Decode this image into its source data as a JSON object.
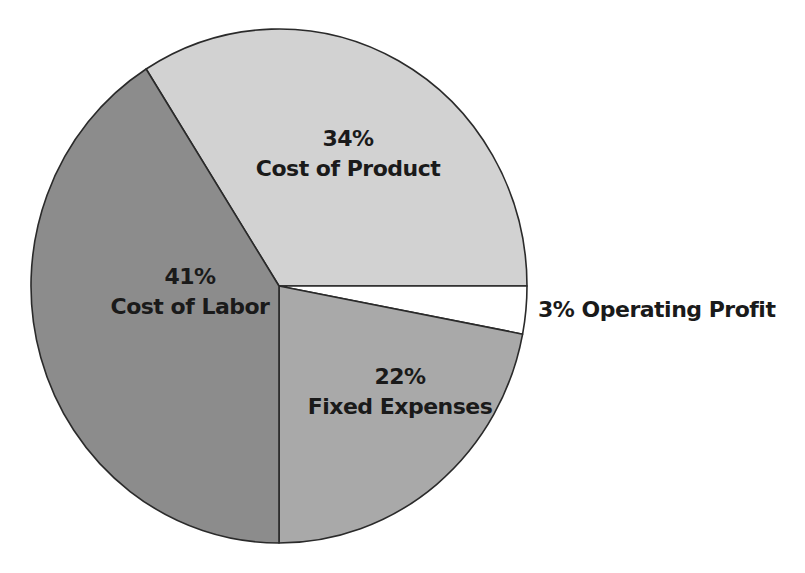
{
  "chart_data": {
    "type": "pie",
    "title": "",
    "slices": [
      {
        "label": "Cost of Product",
        "value": 34,
        "display": "34%",
        "color": "#d2d2d2"
      },
      {
        "label": "Operating Profit",
        "value": 3,
        "display": "3%",
        "color": "#ffffff"
      },
      {
        "label": "Fixed Expenses",
        "value": 22,
        "display": "22%",
        "color": "#a9a9a9"
      },
      {
        "label": "Cost of Labor",
        "value": 41,
        "display": "41%",
        "color": "#8c8c8c"
      }
    ],
    "categories": [
      "Cost of Product",
      "Operating Profit",
      "Fixed Expenses",
      "Cost of Labor"
    ],
    "values": [
      34,
      3,
      22,
      41
    ],
    "units": "%",
    "legend": "none (direct labels)"
  },
  "labels": {
    "product": {
      "pct": "34%",
      "name": "Cost of Product"
    },
    "labor": {
      "pct": "41%",
      "name": "Cost of Labor"
    },
    "fixed": {
      "pct": "22%",
      "name": "Fixed Expenses"
    },
    "profit": {
      "text": "3% Operating Profit"
    }
  }
}
